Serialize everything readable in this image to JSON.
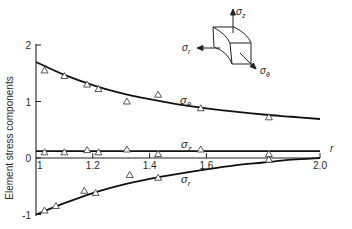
{
  "chart_data": {
    "type": "line",
    "title": "",
    "xlabel": "r",
    "ylabel": "Element stress components",
    "xlim": [
      1.0,
      2.0
    ],
    "ylim": [
      -1,
      2
    ],
    "x_ticks": [
      "1",
      "1.2",
      "1.4",
      "1.6",
      "2.0"
    ],
    "y_ticks": [
      "2",
      "1",
      "0",
      "-1"
    ],
    "grid": false,
    "series": [
      {
        "name": "σθ",
        "curve": {
          "x": [
            1.0,
            1.1,
            1.2,
            1.3,
            1.4,
            1.5,
            1.6,
            1.7,
            1.8,
            1.9,
            2.0
          ],
          "y": [
            1.7,
            1.47,
            1.29,
            1.15,
            1.04,
            0.95,
            0.88,
            0.82,
            0.77,
            0.73,
            0.69
          ]
        },
        "points": {
          "x": [
            1.03,
            1.1,
            1.18,
            1.22,
            1.32,
            1.43,
            1.58,
            1.82
          ],
          "y": [
            1.55,
            1.45,
            1.3,
            1.22,
            1.0,
            1.12,
            0.88,
            0.72
          ]
        }
      },
      {
        "name": "σz",
        "curve": {
          "x": [
            1.0,
            2.0
          ],
          "y": [
            0.12,
            0.12
          ]
        },
        "points": {
          "x": [
            1.03,
            1.1,
            1.18,
            1.22,
            1.32,
            1.43,
            1.58,
            1.82
          ],
          "y": [
            0.1,
            0.1,
            0.14,
            0.1,
            0.15,
            0.07,
            0.15,
            0.07
          ]
        }
      },
      {
        "name": "σr",
        "curve": {
          "x": [
            1.0,
            1.1,
            1.2,
            1.3,
            1.4,
            1.5,
            1.6,
            1.7,
            1.8,
            1.9,
            2.0
          ],
          "y": [
            -1.0,
            -0.8,
            -0.62,
            -0.48,
            -0.37,
            -0.28,
            -0.2,
            -0.13,
            -0.08,
            -0.03,
            0.0
          ]
        },
        "points": {
          "x": [
            1.03,
            1.07,
            1.17,
            1.21,
            1.33,
            1.43,
            1.82
          ],
          "y": [
            -0.93,
            -0.85,
            -0.58,
            -0.62,
            -0.3,
            -0.35,
            -0.03
          ]
        }
      }
    ],
    "annotations": [
      {
        "text": "σθ",
        "x": 1.45,
        "y": 0.95
      },
      {
        "text": "σz",
        "x": 1.49,
        "y": 0.24
      },
      {
        "text": "σr",
        "x": 1.49,
        "y": -0.42
      },
      {
        "text": "stress element inset with σz, σr, σθ arrows"
      }
    ]
  },
  "labels": {
    "ylabel": "Element stress components",
    "xlabel": "r",
    "sigma_theta": "σ",
    "sigma_theta_sub": "θ",
    "sigma_z": "σ",
    "sigma_z_sub": "z",
    "sigma_r": "σ",
    "sigma_r_sub": "r",
    "inset_z": "σ",
    "inset_z_sub": "z",
    "inset_r": "σ",
    "inset_r_sub": "r",
    "inset_theta": "σ",
    "inset_theta_sub": "θ"
  }
}
